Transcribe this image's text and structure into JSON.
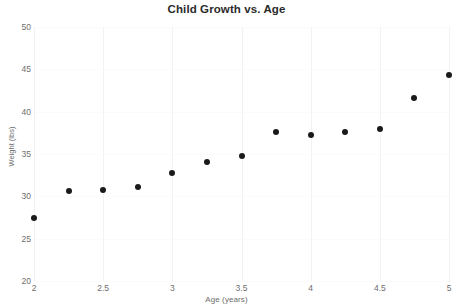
{
  "chart_data": {
    "type": "scatter",
    "title": "Child Growth vs. Age",
    "xlabel": "Age (years)",
    "ylabel": "Weight (lbs)",
    "xlim": [
      2,
      5
    ],
    "ylim": [
      20,
      50
    ],
    "xticks": [
      "2",
      "2.5",
      "3",
      "3.5",
      "4",
      "4.5",
      "5"
    ],
    "xtick_values": [
      2,
      2.5,
      3,
      3.5,
      4,
      4.5,
      5
    ],
    "yticks": [
      "20",
      "25",
      "30",
      "35",
      "40",
      "45",
      "50"
    ],
    "ytick_values": [
      20,
      25,
      30,
      35,
      40,
      45,
      50
    ],
    "grid": true,
    "legend": false,
    "marker_color": "#1a1a1a",
    "x": [
      2,
      2.25,
      2.5,
      2.75,
      3,
      3.25,
      3.5,
      3.75,
      4,
      4.25,
      4.5,
      4.75,
      5
    ],
    "y": [
      27.5,
      30.6,
      30.8,
      31.1,
      32.8,
      34.1,
      34.8,
      37.6,
      37.3,
      37.6,
      37.9,
      41.6,
      44.3
    ],
    "points": [
      {
        "x": 2,
        "y": 27.5
      },
      {
        "x": 2.25,
        "y": 30.6
      },
      {
        "x": 2.5,
        "y": 30.8
      },
      {
        "x": 2.75,
        "y": 31.1
      },
      {
        "x": 3,
        "y": 32.8
      },
      {
        "x": 3.25,
        "y": 34.1
      },
      {
        "x": 3.5,
        "y": 34.8
      },
      {
        "x": 3.75,
        "y": 37.6
      },
      {
        "x": 4,
        "y": 37.3
      },
      {
        "x": 4.25,
        "y": 37.6
      },
      {
        "x": 4.5,
        "y": 37.9
      },
      {
        "x": 4.75,
        "y": 41.6
      },
      {
        "x": 5,
        "y": 44.3
      }
    ]
  }
}
